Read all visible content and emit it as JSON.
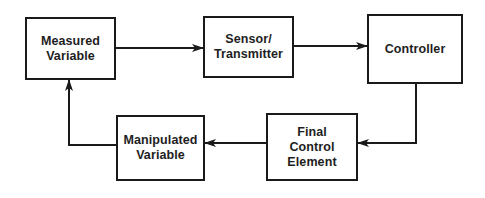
{
  "diagram": {
    "type": "control-loop-block-diagram",
    "colors": {
      "stroke": "#1a1a1a",
      "text": "#1e1e1e",
      "background": "#ffffff"
    },
    "blocks": [
      {
        "id": "measured_variable",
        "label": "Measured\nVariable",
        "x": 25,
        "y": 17,
        "w": 91,
        "h": 63
      },
      {
        "id": "sensor_transmitter",
        "label": "Sensor/\nTransmitter",
        "x": 203,
        "y": 16,
        "w": 91,
        "h": 62
      },
      {
        "id": "controller",
        "label": "Controller",
        "x": 367,
        "y": 14,
        "w": 96,
        "h": 70
      },
      {
        "id": "manipulated_variable",
        "label": "Manipulated\nVariable",
        "x": 116,
        "y": 115,
        "w": 89,
        "h": 66
      },
      {
        "id": "final_control_element",
        "label": "Final\nControl\nElement",
        "x": 266,
        "y": 113,
        "w": 92,
        "h": 68
      }
    ],
    "edges": [
      {
        "from": "measured_variable",
        "to": "sensor_transmitter"
      },
      {
        "from": "sensor_transmitter",
        "to": "controller"
      },
      {
        "from": "controller",
        "to": "final_control_element"
      },
      {
        "from": "final_control_element",
        "to": "manipulated_variable"
      },
      {
        "from": "manipulated_variable",
        "to": "measured_variable"
      }
    ]
  }
}
